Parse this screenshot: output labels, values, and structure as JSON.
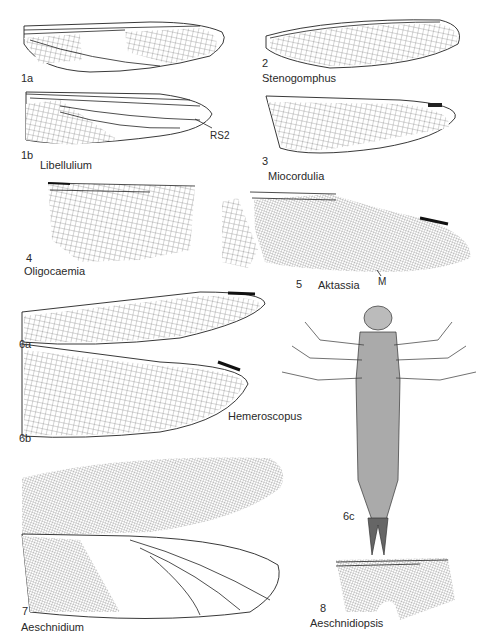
{
  "figure": {
    "type": "scientific plate",
    "panels": [
      {
        "id": "1a",
        "label": "1a"
      },
      {
        "id": "1b",
        "label": "1b",
        "annotation": "RS2"
      },
      {
        "id": "2",
        "label": "2"
      },
      {
        "id": "3",
        "label": "3"
      },
      {
        "id": "4",
        "label": "4"
      },
      {
        "id": "5",
        "label": "5",
        "annotation": "M"
      },
      {
        "id": "6a",
        "label": "6a"
      },
      {
        "id": "6b",
        "label": "6b"
      },
      {
        "id": "6c",
        "label": "6c"
      },
      {
        "id": "7",
        "label": "7"
      },
      {
        "id": "8",
        "label": "8"
      }
    ],
    "taxa": {
      "libellulium": "Libellulium",
      "stenogomphus": "Stenogomphus",
      "miocordulia": "Miocordulia",
      "oligocaemia": "Oligocaemia",
      "aktassia": "Aktassia",
      "hemeroscopus": "Hemeroscopus",
      "aeschnidium": "Aeschnidium",
      "aeschnidiopsis": "Aeschnidiopsis"
    }
  }
}
